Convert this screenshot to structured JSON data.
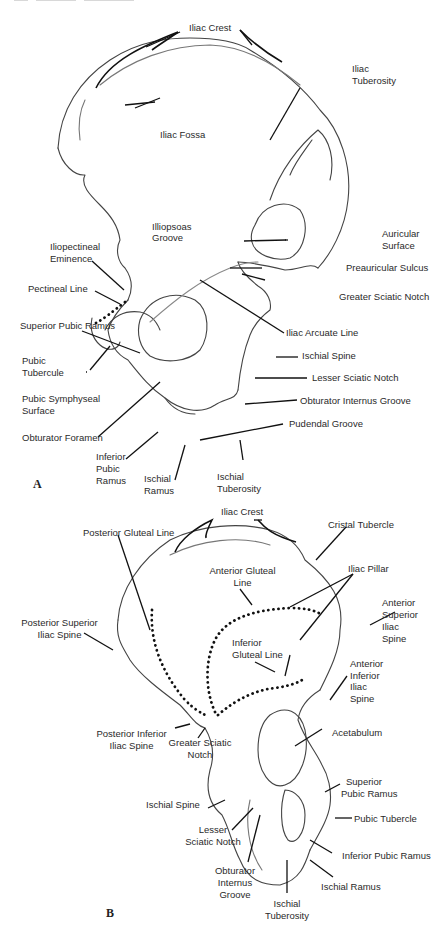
{
  "page_header": {
    "text_visible": "(cropped running header)"
  },
  "figure_a": {
    "panel_letter": "A",
    "labels": {
      "iliac_crest": "Iliac Crest",
      "iliac_tuberosity": [
        "Iliac",
        "Tuberosity"
      ],
      "iliac_fossa": "Iliac Fossa",
      "illiopsoas_groove": [
        "Illiopsoas",
        "Groove"
      ],
      "auricular_surface": [
        "Auricular",
        "Surface"
      ],
      "iliopectineal_eminence": [
        "Iliopectineal",
        "Eminence"
      ],
      "preauricular_sulcus": "Preauricular Sulcus",
      "greater_sciatic_notch": "Greater Sciatic Notch",
      "pectineal_line": "Pectineal Line",
      "iliac_arcuate_line": "Iliac Arcuate Line",
      "superior_pubic_ramus": "Superior Pubic Ramus",
      "ischial_spine": "Ischial Spine",
      "pubic_tubercule": [
        "Pubic",
        "Tubercule"
      ],
      "lesser_sciatic_notch": "Lesser Sciatic Notch",
      "pubic_symphyseal_surface": [
        "Pubic Symphyseal",
        "Surface"
      ],
      "obturator_internus_groove": "Obturator Internus Groove",
      "pudendal_groove": "Pudendal Groove",
      "obturator_foramen": "Obturator Foramen",
      "inferior_pubic_ramus": [
        "Inferior",
        "Pubic",
        "Ramus"
      ],
      "ischial_ramus": [
        "Ischial",
        "Ramus"
      ],
      "ischial_tuberosity": [
        "Ischial",
        "Tuberosity"
      ]
    }
  },
  "figure_b": {
    "panel_letter": "B",
    "labels": {
      "iliac_crest": "Iliac Crest",
      "posterior_gluteal_line": "Posterior Gluteal Line",
      "cristal_tubercle": "Cristal Tubercle",
      "anterior_gluteal_line": [
        "Anterior Gluteal",
        "Line"
      ],
      "iliac_pillar": "Iliac Pillar",
      "anterior_superior_iliac_spine": [
        "Anterior",
        "Superior",
        "Iliac",
        "Spine"
      ],
      "posterior_superior_iliac_spine": [
        "Posterior Superior",
        "Iliac Spine"
      ],
      "inferior_gluteal_line": [
        "Inferior",
        "Gluteal Line"
      ],
      "anterior_inferior_iliac_spine": [
        "Anterior",
        "Inferior",
        "Iliac",
        "Spine"
      ],
      "posterior_inferior_iliac_spine": [
        "Posterior Inferior",
        "Iliac Spine"
      ],
      "greater_sciatic_notch": [
        "Greater Sciatic",
        "Notch"
      ],
      "acetabulum": "Acetabulum",
      "ischial_spine": "Ischial Spine",
      "superior_pubic_ramus": [
        "Superior",
        "Pubic Ramus"
      ],
      "pubic_tubercle": "Pubic Tubercle",
      "lesser_sciatic_notch": [
        "Lesser",
        "Sciatic Notch"
      ],
      "inferior_pubic_ramus": "Inferior Pubic Ramus",
      "obturator_internus_groove": [
        "Obturator",
        "Internus",
        "Groove"
      ],
      "ischial_ramus": "Ischial Ramus",
      "ischial_tuberosity": [
        "Ischial",
        "Tuberosity"
      ]
    }
  },
  "colors": {
    "line": "#1a1a1a",
    "outline": "#444444",
    "text": "#2a2a2a",
    "background": "#ffffff"
  }
}
